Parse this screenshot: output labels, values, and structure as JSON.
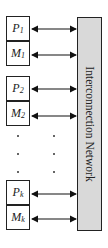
{
  "diagram": {
    "network_label": "Interconnection Network",
    "network_fill": "#d9d9d9",
    "nodes": [
      {
        "id": "P1",
        "letter": "P",
        "sub": "1",
        "top": 16
      },
      {
        "id": "M1",
        "letter": "M",
        "sub": "1",
        "top": 42
      },
      {
        "id": "P2",
        "letter": "P",
        "sub": "2",
        "top": 76
      },
      {
        "id": "M2",
        "letter": "M",
        "sub": "2",
        "top": 102
      },
      {
        "id": "Pk",
        "letter": "P",
        "sub": "k",
        "top": 179
      },
      {
        "id": "Mk",
        "letter": "M",
        "sub": "k",
        "top": 205
      }
    ],
    "edges": "bidirectional arrow from each node to Interconnection Network",
    "ellipsis": "vertical dots between M2 and Pk"
  }
}
